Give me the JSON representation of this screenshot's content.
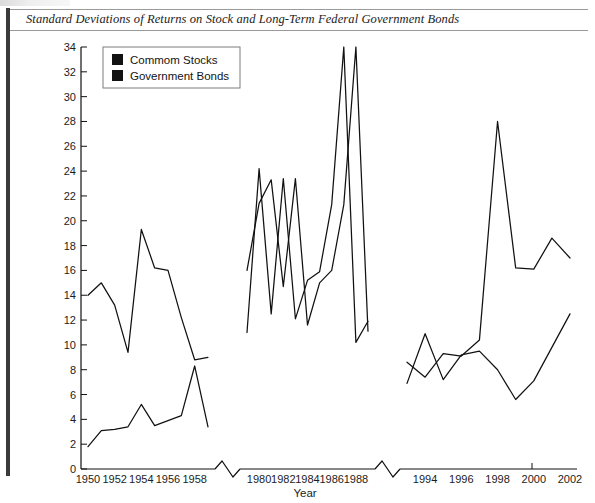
{
  "figure": {
    "title": "Standard Deviations of Returns on Stock and Long-Term Federal Government Bonds"
  },
  "legend": {
    "position": "top-left-inside",
    "items": [
      {
        "label": "Commom Stocks",
        "swatch": "#121212",
        "name": "common-stocks"
      },
      {
        "label": "Government Bonds",
        "swatch": "#2a2a2a",
        "name": "government-bonds"
      }
    ]
  },
  "axes": {
    "x_title": "Year",
    "y_title": "",
    "y_ticks": [
      "0",
      "2",
      "4",
      "6",
      "8",
      "10",
      "12",
      "14",
      "16",
      "18",
      "20",
      "22",
      "24",
      "26",
      "28",
      "30",
      "32",
      "34"
    ],
    "x_tick_labels_segment1": [
      "1950",
      "1952",
      "1954",
      "1956",
      "1958"
    ],
    "x_tick_labels_segment2": [
      "1980",
      "1982",
      "1984",
      "1986",
      "1988"
    ],
    "x_tick_labels_segment3": [
      "1994",
      "1996",
      "1998",
      "2000",
      "2002"
    ],
    "breaks": 2
  },
  "chart_data": {
    "type": "line",
    "title": "Standard Deviations of Returns on Stock and Long-Term Federal Government Bonds",
    "xlabel": "Year",
    "ylabel": "",
    "ylim": [
      0,
      34
    ],
    "ygrid": false,
    "axis_breaks": [
      [
        1959,
        1979
      ],
      [
        1989,
        1993
      ]
    ],
    "legend_position": "upper left",
    "series": [
      {
        "name": "Commom Stocks",
        "color": "#111111",
        "segments": [
          {
            "x": [
              1950,
              1951,
              1952,
              1953,
              1954,
              1955,
              1956,
              1957,
              1958,
              1959
            ],
            "y": [
              14.0,
              15.0,
              13.2,
              9.4,
              19.3,
              16.2,
              16.0,
              12.2,
              8.8,
              9.0
            ]
          },
          {
            "x": [
              1979,
              1980,
              1981,
              1982,
              1983,
              1984,
              1985,
              1986,
              1987,
              1988,
              1989
            ],
            "y": [
              11.0,
              24.2,
              12.5,
              23.4,
              12.1,
              15.2,
              15.9,
              21.3,
              34.0,
              10.2,
              11.9
            ]
          },
          {
            "x": [
              1993,
              1994,
              1995,
              1996,
              1997,
              1998,
              1999,
              2000,
              2001,
              2002
            ],
            "y": [
              8.6,
              7.4,
              9.3,
              9.1,
              10.4,
              28.0,
              16.2,
              16.1,
              18.6,
              17.0
            ]
          }
        ]
      },
      {
        "name": "Government Bonds",
        "color": "#111111",
        "segments": [
          {
            "x": [
              1950,
              1951,
              1952,
              1953,
              1954,
              1955,
              1956,
              1957,
              1958,
              1959
            ],
            "y": [
              1.8,
              3.1,
              3.2,
              3.4,
              5.2,
              3.5,
              3.9,
              4.3,
              8.3,
              3.4
            ]
          },
          {
            "x": [
              1979,
              1980,
              1981,
              1982,
              1983,
              1984,
              1985,
              1986,
              1987,
              1988,
              1989
            ],
            "y": [
              16.0,
              21.4,
              23.3,
              14.7,
              23.4,
              11.6,
              15.0,
              16.0,
              21.3,
              34.0,
              11.1
            ]
          },
          {
            "x": [
              1993,
              1994,
              1995,
              1996,
              1997,
              1998,
              1999,
              2000,
              2001,
              2002
            ],
            "y": [
              6.9,
              10.9,
              7.2,
              9.2,
              9.5,
              8.0,
              5.6,
              7.1,
              9.8,
              12.5
            ]
          }
        ]
      }
    ]
  }
}
